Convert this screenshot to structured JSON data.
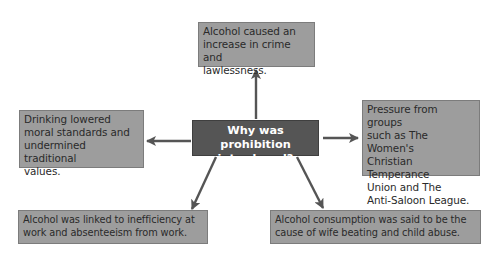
{
  "diagram": {
    "central_question": "Why was prohibition introduced?",
    "central_lines": [
      "Why was prohibition",
      "introduced?"
    ],
    "colors": {
      "box_fill": "#9d9d9d",
      "center_fill": "#555555",
      "arrow": "#555555",
      "text_dark": "#2a2a2a",
      "text_light": "#ffffff"
    },
    "causes": [
      {
        "id": "top",
        "lines": [
          "Alcohol caused an",
          "increase in crime and",
          "lawlessness."
        ]
      },
      {
        "id": "left",
        "lines": [
          "Drinking lowered",
          "moral standards and",
          "undermined traditional",
          "values."
        ]
      },
      {
        "id": "right",
        "lines": [
          "Pressure from groups",
          "such as The Women's",
          "Christian Temperance",
          "Union and The",
          "Anti-Saloon League."
        ]
      },
      {
        "id": "bottom-left",
        "lines": [
          "Alcohol was linked to inefficiency at",
          "work and absenteeism from work."
        ]
      },
      {
        "id": "bottom-right",
        "lines": [
          "Alcohol consumption was said to be the",
          "cause of wife beating and child abuse."
        ]
      }
    ]
  }
}
